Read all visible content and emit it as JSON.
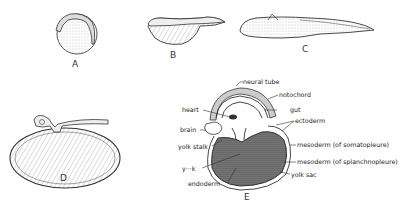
{
  "figure": {
    "panels": [
      {
        "id": "A",
        "label": "A"
      },
      {
        "id": "B",
        "label": "B"
      },
      {
        "id": "C",
        "label": "C"
      },
      {
        "id": "D",
        "label": "D"
      },
      {
        "id": "E",
        "label": "E"
      }
    ],
    "annotations": {
      "neural_tube": "neural tube",
      "notochord": "notochord",
      "gut": "gut",
      "heart": "heart",
      "brain": "brain",
      "ectoderm": "ectoderm",
      "yolk_stalk": "yolk stalk",
      "mesoderm_somatopleure": "mesoderm (of somatopleure)",
      "mesoderm_splanchnopleure": "mesoderm (of splanchnopleure)",
      "yolk": "y···k",
      "yolk_sac": "yolk sac",
      "endoderm": "endoderm"
    }
  }
}
